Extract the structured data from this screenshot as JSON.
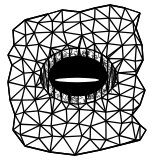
{
  "figure": {
    "type": "unstructured-triangular-mesh",
    "colors": {
      "background": "#ffffff",
      "mesh": "#000000",
      "airfoil": "#ffffff"
    },
    "boundary": [
      [
        13,
        30
      ],
      [
        25,
        20
      ],
      [
        48,
        14
      ],
      [
        62,
        10
      ],
      [
        80,
        12
      ],
      [
        95,
        8
      ],
      [
        110,
        5
      ],
      [
        125,
        8
      ],
      [
        140,
        13
      ],
      [
        136,
        28
      ],
      [
        142,
        45
      ],
      [
        143,
        60
      ],
      [
        136,
        75
      ],
      [
        145,
        90
      ],
      [
        140,
        105
      ],
      [
        132,
        115
      ],
      [
        140,
        125
      ],
      [
        146,
        130
      ],
      [
        140,
        140
      ],
      [
        120,
        145
      ],
      [
        100,
        150
      ],
      [
        75,
        155
      ],
      [
        50,
        152
      ],
      [
        25,
        146
      ],
      [
        13,
        130
      ],
      [
        15,
        115
      ],
      [
        10,
        100
      ],
      [
        8,
        82
      ],
      [
        12,
        65
      ],
      [
        8,
        55
      ],
      [
        14,
        45
      ]
    ],
    "airfoil": {
      "cx": 77,
      "cy": 80,
      "rx": 22,
      "ry": 2.2
    },
    "dense_region": {
      "cx": 78,
      "cy": 76,
      "rx": 36,
      "ry": 26
    }
  }
}
